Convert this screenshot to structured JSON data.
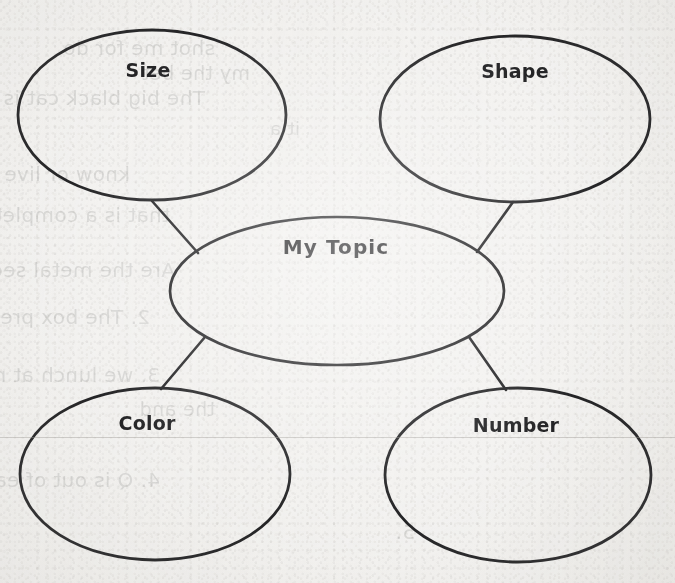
{
  "document": {
    "type": "worksheet",
    "kind": "concept-map",
    "background_color": "#f3f2f0",
    "ink_color": "#19191b"
  },
  "diagram": {
    "type": "bubble-map",
    "center": {
      "id": "center",
      "label": "My Topic",
      "cx": 337,
      "cy": 291,
      "rx": 167,
      "ry": 74,
      "label_x": 336,
      "label_y": 247
    },
    "nodes": [
      {
        "id": "size",
        "label": "Size",
        "position": "top-left",
        "cx": 152,
        "cy": 115,
        "rx": 134,
        "ry": 85,
        "label_x": 148,
        "label_y": 70
      },
      {
        "id": "shape",
        "label": "Shape",
        "position": "top-right",
        "cx": 515,
        "cy": 119,
        "rx": 135,
        "ry": 83,
        "label_x": 515,
        "label_y": 71
      },
      {
        "id": "color",
        "label": "Color",
        "position": "bottom-left",
        "cx": 155,
        "cy": 474,
        "rx": 135,
        "ry": 86,
        "label_x": 147,
        "label_y": 423
      },
      {
        "id": "number",
        "label": "Number",
        "position": "bottom-right",
        "cx": 518,
        "cy": 475,
        "rx": 133,
        "ry": 87,
        "label_x": 516,
        "label_y": 425
      }
    ],
    "connectors": [
      {
        "id": "connector-size-center",
        "from": "size",
        "to": "center",
        "x1": 152,
        "y1": 201,
        "x2": 198,
        "y2": 253
      },
      {
        "id": "connector-shape-center",
        "from": "shape",
        "to": "center",
        "x1": 513,
        "y1": 202,
        "x2": 477,
        "y2": 252
      },
      {
        "id": "connector-color-center",
        "from": "color",
        "to": "center",
        "x1": 205,
        "y1": 337,
        "x2": 161,
        "y2": 389
      },
      {
        "id": "connector-number-center",
        "from": "number",
        "to": "center",
        "x1": 469,
        "y1": 337,
        "x2": 506,
        "y2": 390
      }
    ],
    "rule_lines": [
      {
        "id": "rule-line-1",
        "x": 0,
        "y": 437,
        "width": 675
      }
    ]
  },
  "ghost_text": {
    "description": "faint show-through of handwriting/print from the reverse side of the page",
    "lines": [
      {
        "id": "g1",
        "text": "shot me for do",
        "x": 215,
        "y": 36,
        "size": 20
      },
      {
        "id": "g2",
        "text": "my the  bet",
        "x": 250,
        "y": 62,
        "size": 19
      },
      {
        "id": "g3",
        "text": "The big black cat is the best",
        "x": 205,
        "y": 86,
        "size": 20
      },
      {
        "id": "g4",
        "text": "it a",
        "x": 300,
        "y": 118,
        "size": 18
      },
      {
        "id": "g5",
        "text": "know or live under each group it up at",
        "x": 130,
        "y": 162,
        "size": 20
      },
      {
        "id": "g6",
        "text": "that is a complete sentence  is a",
        "x": 170,
        "y": 203,
        "size": 20
      },
      {
        "id": "g7",
        "text": "Are the metal seed",
        "x": 175,
        "y": 258,
        "size": 20
      },
      {
        "id": "g8",
        "text": "2. The box pre-letters",
        "x": 150,
        "y": 305,
        "size": 20
      },
      {
        "id": "g9",
        "text": "3. we lunch at  nam",
        "x": 160,
        "y": 363,
        "size": 20
      },
      {
        "id": "g10",
        "text": "the       and",
        "x": 215,
        "y": 398,
        "size": 19
      },
      {
        "id": "g11",
        "text": "4. Q is out of each to the right",
        "x": 160,
        "y": 468,
        "size": 20
      },
      {
        "id": "g12",
        "text": "5.",
        "x": 415,
        "y": 520,
        "size": 20
      }
    ]
  }
}
